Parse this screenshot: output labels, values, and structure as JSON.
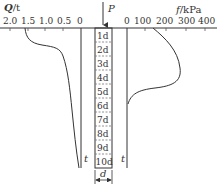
{
  "diagram": {
    "type": "pile-load-transfer",
    "left_axis": {
      "label_var": "Q",
      "label_unit": "/t",
      "ticks": [
        "2.0",
        "1.5",
        "1.0",
        "0.5",
        "0"
      ]
    },
    "right_axis": {
      "label_var": "f",
      "label_unit": "/kPa",
      "ticks": [
        "0",
        "100",
        "200",
        "300",
        "400"
      ]
    },
    "load_label": "P",
    "pile_segments": [
      "1d",
      "2d",
      "3d",
      "4d",
      "5d",
      "6d",
      "7d",
      "8d",
      "9d",
      "10d"
    ],
    "left_curve_label": "t",
    "right_curve_label": "t",
    "width_label": "d",
    "line_color": "#333333",
    "dash_color": "#777777"
  }
}
